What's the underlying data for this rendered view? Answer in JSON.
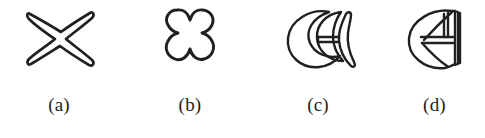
{
  "figure": {
    "background_color": "#ffffff",
    "ink_color": "#231f20",
    "panel_count": 4,
    "panels": [
      {
        "id": "a",
        "caption": "(a)",
        "shape_name": "x-cross-outline-shape",
        "shape_description": "hand-drawn outline of an X / four-pointed cross"
      },
      {
        "id": "b",
        "caption": "(b)",
        "shape_name": "four-lobed-clover-outline-shape",
        "shape_description": "hand-drawn outline of a four-lobed clover / flower"
      },
      {
        "id": "c",
        "caption": "(c)",
        "shape_name": "crescent-with-nested-crescent-and-fin-shape",
        "shape_description": "hand-drawn crescent containing a nested crescent and a fin with a horizontal bar"
      },
      {
        "id": "d",
        "caption": "(d)",
        "shape_name": "d-shape-with-internal-bars",
        "shape_description": "hand-drawn D-like disc with flat right edge and internal horizontal and vertical bars"
      }
    ]
  }
}
